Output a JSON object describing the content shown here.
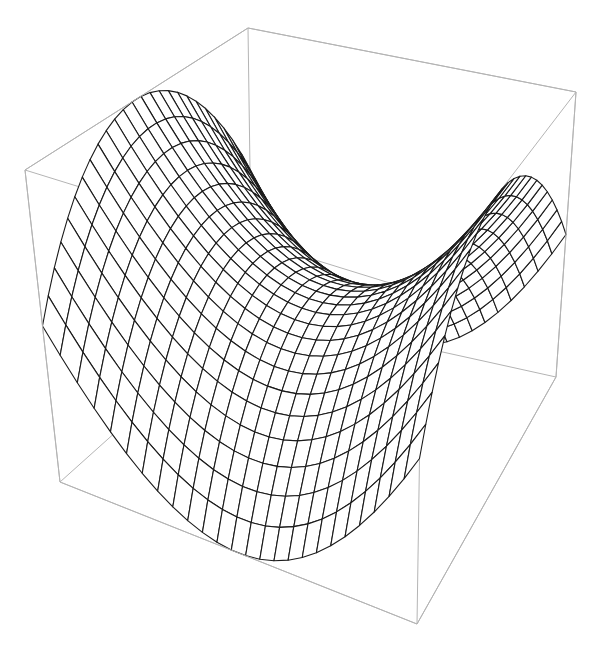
{
  "chart_data": {
    "type": "surface3d",
    "title": "",
    "function": "z = x^2 - y^2",
    "style": "wireframe mesh on white surface, bounding box, no axes labels",
    "x_range": [
      -1,
      1
    ],
    "y_range": [
      -1,
      1
    ],
    "z_range": [
      -1,
      1
    ],
    "mesh_divisions": 25,
    "axes_labels_visible": false,
    "ticks_visible": false,
    "boxed": true,
    "colors": {
      "background": "#ffffff",
      "surface": "#ffffff",
      "mesh": "#1a1a1a",
      "box": "#b4b4b4"
    },
    "projected_box_corners": {
      "top_c": [
        25,
        170
      ],
      "top_a": [
        248,
        28
      ],
      "top_b": [
        576,
        92
      ],
      "top_q": [
        422,
        293
      ],
      "bot_bl": [
        60,
        482
      ],
      "bot_p": [
        252,
        310
      ],
      "bot_br": [
        556,
        377
      ],
      "bot_bf": [
        417,
        624
      ]
    }
  }
}
